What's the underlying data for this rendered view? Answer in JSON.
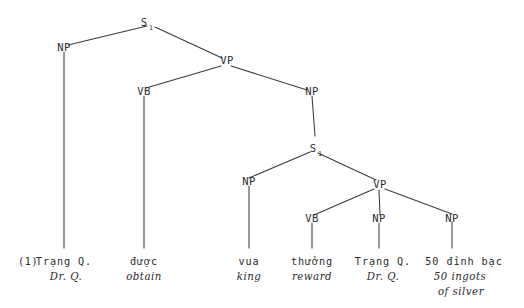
{
  "figure": {
    "example_number": "(1)",
    "type": "syntax-tree"
  },
  "nodes": {
    "s_top": {
      "label": "S",
      "subscript": "1"
    },
    "np_subject": {
      "label": "NP"
    },
    "vp_matrix": {
      "label": "VP"
    },
    "vb_matrix": {
      "label": "VB"
    },
    "np_object": {
      "label": "NP"
    },
    "s_embedded": {
      "label": "S",
      "subscript": "1"
    },
    "np_embedded_subject": {
      "label": "NP"
    },
    "vp_embedded": {
      "label": "VP"
    },
    "vb_embedded": {
      "label": "VB"
    },
    "np_embedded_obj1": {
      "label": "NP"
    },
    "np_embedded_obj2": {
      "label": "NP"
    }
  },
  "terminals": [
    {
      "id": "terminal-trang-q-1",
      "source": "Trạng Q.",
      "gloss_lines": [
        "Dr. Q."
      ]
    },
    {
      "id": "terminal-duoc",
      "source": "được",
      "gloss_lines": [
        "obtain"
      ]
    },
    {
      "id": "terminal-vua",
      "source": "vua",
      "gloss_lines": [
        "king"
      ]
    },
    {
      "id": "terminal-thuong",
      "source": "thưởng",
      "gloss_lines": [
        "reward"
      ]
    },
    {
      "id": "terminal-trang-q-2",
      "source": "Trạng Q.",
      "gloss_lines": [
        "Dr. Q."
      ]
    },
    {
      "id": "terminal-dinh-bac",
      "source": "50 đỉnh bạc",
      "gloss_lines": [
        "50 ingots",
        "of silver"
      ]
    }
  ],
  "colors": {
    "ink": "#2b2b2b",
    "line": "#3a3a3a",
    "background": "#ffffff"
  }
}
